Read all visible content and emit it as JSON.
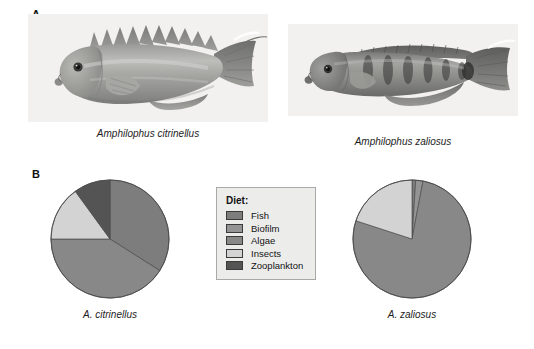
{
  "figure": {
    "panels": [
      {
        "letter": "A",
        "name": "photographs"
      },
      {
        "letter": "B",
        "name": "diet-pie-charts"
      }
    ]
  },
  "panel_a": {
    "letter": "A",
    "specimens": [
      {
        "caption": "Amphilophus citrinellus",
        "icon": "fish-photo-icon"
      },
      {
        "caption": "Amphilophus zaliosus",
        "icon": "fish-photo-icon"
      }
    ]
  },
  "panel_b": {
    "letter": "B",
    "legend": {
      "title": "Diet:",
      "items": [
        {
          "label": "Fish",
          "color": "#7d7d7d"
        },
        {
          "label": "Biofilm",
          "color": "#949494"
        },
        {
          "label": "Algae",
          "color": "#888888"
        },
        {
          "label": "Insects",
          "color": "#d3d3d3"
        },
        {
          "label": "Zooplankton",
          "color": "#545454"
        }
      ]
    },
    "captions": {
      "left": "A. citrinellus",
      "right": "A. zaliosus"
    }
  },
  "chart_data": [
    {
      "type": "pie",
      "title": "A. citrinellus",
      "labels": [
        "Fish",
        "Biofilm",
        "Algae",
        "Insects",
        "Zooplankton"
      ],
      "colors": [
        "#7d7d7d",
        "#949494",
        "#888888",
        "#d3d3d3",
        "#545454"
      ],
      "values": [
        34,
        0,
        41,
        15,
        10
      ],
      "units": "percent",
      "start_angle": 0,
      "direction": "clockwise",
      "legend": "center"
    },
    {
      "type": "pie",
      "title": "A. zaliosus",
      "labels": [
        "Fish",
        "Biofilm",
        "Algae",
        "Insects",
        "Zooplankton"
      ],
      "colors": [
        "#7d7d7d",
        "#949494",
        "#888888",
        "#d3d3d3",
        "#545454"
      ],
      "values": [
        1,
        2,
        77,
        20,
        0
      ],
      "units": "percent",
      "start_angle": 0,
      "direction": "clockwise",
      "legend": "center"
    }
  ]
}
